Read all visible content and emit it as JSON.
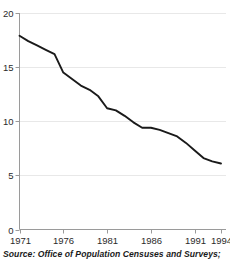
{
  "source": {
    "text": "Source: Office of Population Censuses and Surveys;"
  },
  "chart_data": {
    "type": "line",
    "title": "",
    "subtitle": "",
    "xlabel": "",
    "ylabel": "",
    "xlim": [
      1971,
      1994
    ],
    "ylim": [
      0,
      20
    ],
    "grid": true,
    "legend": false,
    "legend_position": "none",
    "line_color": "#1a1a1a",
    "axis_color": "#808080",
    "grid_color": "#e8e8e8",
    "yticks": [
      0,
      5,
      10,
      15,
      20
    ],
    "ytick_labels": [
      "0",
      "5",
      "10",
      "15",
      "20"
    ],
    "xticks": [
      1971,
      1976,
      1981,
      1986,
      1991,
      1994
    ],
    "xtick_labels": [
      "1971",
      "1976",
      "1981",
      "1986",
      "1991",
      "1994"
    ],
    "x": [
      1971,
      1972,
      1973,
      1974,
      1975,
      1976,
      1977,
      1978,
      1979,
      1980,
      1981,
      1982,
      1983,
      1984,
      1985,
      1986,
      1987,
      1988,
      1989,
      1990,
      1991,
      1992,
      1993,
      1994
    ],
    "values": [
      17.9,
      17.4,
      17.0,
      16.6,
      16.2,
      14.5,
      13.9,
      13.3,
      12.9,
      12.3,
      11.2,
      11.0,
      10.5,
      9.9,
      9.4,
      9.4,
      9.2,
      8.9,
      8.6,
      8.0,
      7.3,
      6.6,
      6.3,
      6.1
    ],
    "series": [
      {
        "name": "rate",
        "values": [
          17.9,
          17.4,
          17.0,
          16.6,
          16.2,
          14.5,
          13.9,
          13.3,
          12.9,
          12.3,
          11.2,
          11.0,
          10.5,
          9.9,
          9.4,
          9.4,
          9.2,
          8.9,
          8.6,
          8.0,
          7.3,
          6.6,
          6.3,
          6.1
        ]
      }
    ]
  }
}
